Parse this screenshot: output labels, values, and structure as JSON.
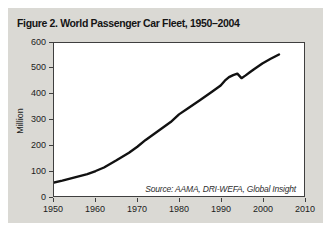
{
  "figure": {
    "title": "Figure 2. World Passenger Car Fleet, 1950–2004"
  },
  "chart_data": {
    "type": "line",
    "title": "Figure 2. World Passenger Car Fleet, 1950–2004",
    "xlabel": "",
    "ylabel": "Million",
    "source_note": "Source: AAMA, DRI-WEFA, Global Insight",
    "xlim": [
      1950,
      2010
    ],
    "ylim": [
      0,
      600
    ],
    "x_ticks": [
      1950,
      1960,
      1970,
      1980,
      1990,
      2000,
      2010
    ],
    "y_ticks": [
      0,
      100,
      200,
      300,
      400,
      500,
      600
    ],
    "grid": false,
    "legend": "none",
    "series": [
      {
        "name": "World passenger car fleet",
        "x": [
          1950,
          1952,
          1955,
          1958,
          1960,
          1962,
          1965,
          1968,
          1970,
          1972,
          1975,
          1978,
          1980,
          1982,
          1985,
          1988,
          1990,
          1991,
          1992,
          1993,
          1994,
          1995,
          1996,
          1997,
          1998,
          2000,
          2002,
          2004
        ],
        "y": [
          53,
          60,
          73,
          86,
          98,
          112,
          140,
          170,
          193,
          220,
          255,
          290,
          320,
          342,
          375,
          410,
          433,
          452,
          466,
          474,
          480,
          462,
          473,
          485,
          497,
          520,
          538,
          555
        ]
      }
    ]
  },
  "colors": {
    "card_bg": "#dad9d4",
    "plot_bg": "#ffffff",
    "axis": "#3f3f3f",
    "text": "#1c1c1c",
    "line": "#111111"
  }
}
